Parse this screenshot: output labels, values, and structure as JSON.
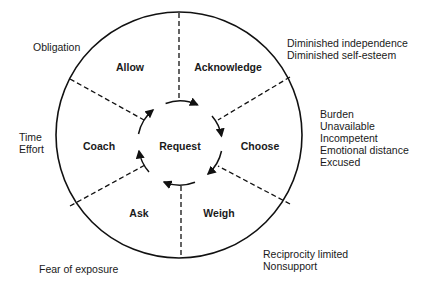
{
  "center": {
    "label": "Request"
  },
  "segments": [
    {
      "id": "allow",
      "label": "Allow"
    },
    {
      "id": "acknowledge",
      "label": "Acknowledge"
    },
    {
      "id": "choose",
      "label": "Choose"
    },
    {
      "id": "weigh",
      "label": "Weigh"
    },
    {
      "id": "ask",
      "label": "Ask"
    },
    {
      "id": "coach",
      "label": "Coach"
    }
  ],
  "barriers": {
    "allow": [
      "Obligation"
    ],
    "acknowledge": [
      "Diminished independence",
      "Diminished self-esteem"
    ],
    "choose": [
      "Burden",
      "Unavailable",
      "Incompetent",
      "Emotional distance",
      "Excused"
    ],
    "weigh": [
      "Reciprocity limited",
      "Nonsupport"
    ],
    "ask": [
      "Fear of exposure"
    ],
    "coach": [
      "Time",
      "Effort"
    ]
  },
  "colors": {
    "line": "#111111",
    "background": "#ffffff"
  }
}
